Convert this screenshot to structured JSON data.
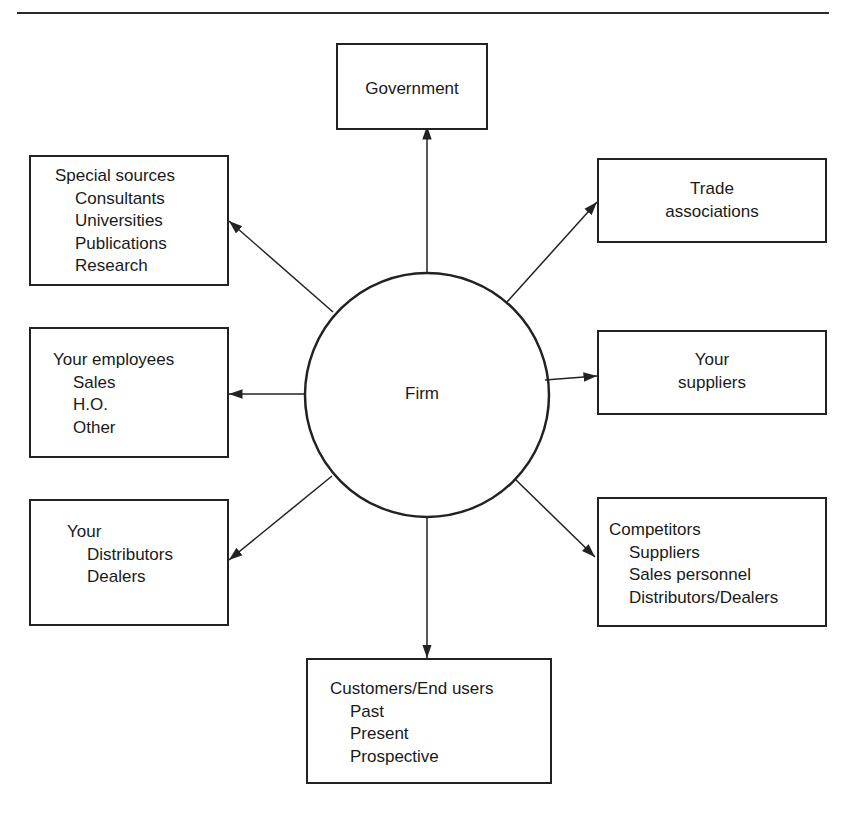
{
  "diagram": {
    "center": {
      "label": "Firm"
    },
    "nodes": {
      "government": {
        "title": "Government",
        "items": []
      },
      "special_sources": {
        "title": "Special sources",
        "items": [
          "Consultants",
          "Universities",
          "Publications",
          "Research"
        ]
      },
      "trade_associations": {
        "title_line1": "Trade",
        "title_line2": "associations",
        "items": []
      },
      "your_employees": {
        "title": "Your employees",
        "items": [
          "Sales",
          "H.O.",
          "Other"
        ]
      },
      "your_suppliers": {
        "title_line1": "Your",
        "title_line2": "suppliers",
        "items": []
      },
      "your_distributors": {
        "title": "Your",
        "items": [
          "Distributors",
          "Dealers"
        ]
      },
      "competitors": {
        "title": "Competitors",
        "items": [
          "Suppliers",
          "Sales personnel",
          "Distributors/Dealers"
        ]
      },
      "customers": {
        "title": "Customers/End users",
        "items": [
          "Past",
          "Present",
          "Prospective"
        ]
      }
    },
    "edges": [
      {
        "from": "Firm",
        "to": "Government"
      },
      {
        "from": "Firm",
        "to": "Special sources"
      },
      {
        "from": "Firm",
        "to": "Trade associations"
      },
      {
        "from": "Firm",
        "to": "Your employees"
      },
      {
        "from": "Firm",
        "to": "Your suppliers"
      },
      {
        "from": "Firm",
        "to": "Your distributors"
      },
      {
        "from": "Firm",
        "to": "Competitors"
      },
      {
        "from": "Firm",
        "to": "Customers/End users"
      }
    ],
    "colors": {
      "stroke": "#222222",
      "background": "#ffffff"
    }
  }
}
